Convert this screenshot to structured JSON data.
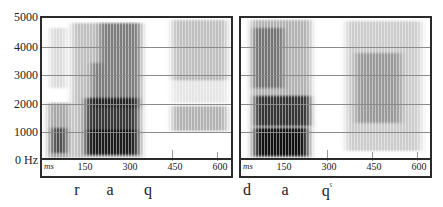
{
  "y_axis": {
    "ticks": [
      "5000",
      "4000",
      "3000",
      "2000",
      "1000",
      "0 Hz"
    ]
  },
  "panels": [
    {
      "id": "left",
      "x_axis": {
        "unit": "ms",
        "ticks": [
          "150",
          "300",
          "450",
          "600"
        ]
      },
      "phonemes": [
        "r",
        "a",
        "q"
      ]
    },
    {
      "id": "right",
      "x_axis": {
        "unit": "ms",
        "ticks": [
          "150",
          "300",
          "450",
          "600"
        ]
      },
      "phonemes": [
        "d",
        "a",
        "q",
        "ˤ"
      ]
    }
  ],
  "colors": {
    "ink": "#2a2a2a",
    "grid": "#8a8a8a"
  }
}
